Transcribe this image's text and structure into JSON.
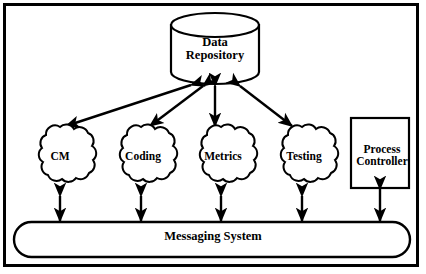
{
  "diagram": {
    "background_color": "#ffffff",
    "line_color": "#000000",
    "frame": {
      "border_width": 3,
      "border_color": "#000000"
    },
    "repository": {
      "label": "Data\nRepository",
      "shape": "cylinder"
    },
    "clouds": [
      {
        "id": "cm",
        "label": "CM",
        "shape": "cloud"
      },
      {
        "id": "coding",
        "label": "Coding",
        "shape": "cloud"
      },
      {
        "id": "metrics",
        "label": "Metrics",
        "shape": "cloud"
      },
      {
        "id": "testing",
        "label": "Testing",
        "shape": "cloud"
      }
    ],
    "process_controller": {
      "label": "Process\nController",
      "shape": "rectangle"
    },
    "bus": {
      "label": "Messaging System",
      "shape": "rounded-rectangle"
    },
    "connectors": {
      "repository_links": [
        {
          "from": "repository",
          "to": "cm",
          "style": "double-arrow"
        },
        {
          "from": "repository",
          "to": "coding",
          "style": "double-arrow"
        },
        {
          "from": "repository",
          "to": "metrics",
          "style": "double-arrow"
        },
        {
          "from": "repository",
          "to": "testing",
          "style": "double-arrow"
        }
      ],
      "bus_links": [
        {
          "from": "cm",
          "to": "bus",
          "style": "double-arrow"
        },
        {
          "from": "coding",
          "to": "bus",
          "style": "double-arrow"
        },
        {
          "from": "metrics",
          "to": "bus",
          "style": "double-arrow"
        },
        {
          "from": "testing",
          "to": "bus",
          "style": "double-arrow"
        },
        {
          "from": "process_controller",
          "to": "bus",
          "style": "double-arrow"
        }
      ]
    }
  }
}
